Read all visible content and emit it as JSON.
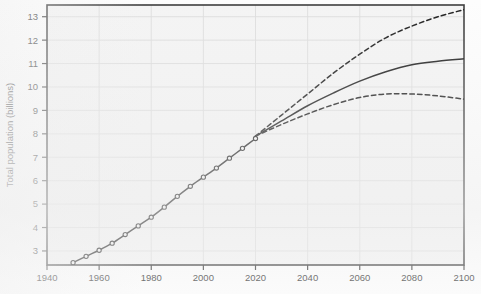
{
  "figure": {
    "background_color": "#fdfdfd",
    "plot_background_color": "#f4f4f4",
    "frame_color": "#3c3c3c",
    "grid_color": "#dcdcdc",
    "series_color": "#1f1f1f",
    "tick_label_color": "#3a3a3a"
  },
  "chart_data": {
    "type": "line",
    "title": "",
    "subtitle": "",
    "xlabel": "",
    "ylabel": "Total population (billions)",
    "xlim": [
      1940,
      2100
    ],
    "ylim": [
      2.4,
      13.5
    ],
    "xticks": [
      1940,
      1960,
      1980,
      2000,
      2020,
      2040,
      2060,
      2080,
      2100
    ],
    "xticklabels": [
      "1940",
      "1960",
      "1980",
      "2000",
      "2020",
      "2040",
      "2060",
      "2080",
      "2100"
    ],
    "yticks": [
      3,
      4,
      5,
      6,
      7,
      8,
      9,
      10,
      11,
      12,
      13
    ],
    "yticklabels": [
      "3",
      "4",
      "5",
      "6",
      "7",
      "8",
      "9",
      "10",
      "11",
      "12",
      "13"
    ],
    "grid": true,
    "legend": false,
    "legend_position": "none",
    "annotations": [],
    "series": [
      {
        "name": "Estimates (historical)",
        "style": "solid",
        "marker": "open-circle",
        "x": [
          1950,
          1955,
          1960,
          1965,
          1970,
          1975,
          1980,
          1985,
          1990,
          1995,
          2000,
          2005,
          2010,
          2015,
          2020
        ],
        "values": [
          2.5,
          2.77,
          3.03,
          3.33,
          3.7,
          4.07,
          4.44,
          4.87,
          5.33,
          5.76,
          6.15,
          6.54,
          6.96,
          7.38,
          7.8
        ]
      },
      {
        "name": "High projection (95% upper)",
        "style": "dashed",
        "marker": "none",
        "x": [
          2020,
          2030,
          2040,
          2050,
          2060,
          2070,
          2080,
          2090,
          2100
        ],
        "values": [
          7.9,
          8.8,
          9.7,
          10.6,
          11.4,
          12.1,
          12.6,
          13.0,
          13.3
        ]
      },
      {
        "name": "Median projection",
        "style": "solid",
        "marker": "none",
        "x": [
          2020,
          2030,
          2040,
          2050,
          2060,
          2070,
          2080,
          2090,
          2100
        ],
        "values": [
          7.9,
          8.55,
          9.2,
          9.75,
          10.25,
          10.65,
          10.95,
          11.1,
          11.2
        ]
      },
      {
        "name": "Low projection (95% lower)",
        "style": "dashed",
        "marker": "none",
        "x": [
          2020,
          2030,
          2040,
          2050,
          2060,
          2070,
          2080,
          2090,
          2100
        ],
        "values": [
          7.9,
          8.4,
          8.85,
          9.25,
          9.55,
          9.7,
          9.7,
          9.62,
          9.48
        ]
      }
    ]
  }
}
